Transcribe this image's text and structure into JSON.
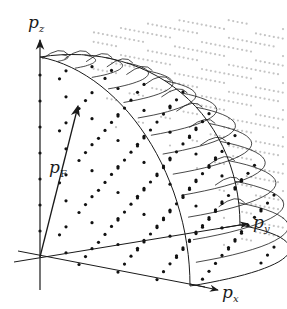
{
  "figure": {
    "axes": {
      "pz": {
        "label": "p",
        "subscript": "z"
      },
      "py": {
        "label": "p",
        "subscript": "y"
      },
      "px": {
        "label": "p",
        "subscript": "x"
      }
    },
    "fermi_vector": {
      "label": "p",
      "subscript": "F"
    },
    "colors": {
      "ink": "#1a1a1a",
      "inside_dots": "#111111",
      "outside_dots": "#c4c4c4",
      "background": "#ffffff"
    }
  }
}
